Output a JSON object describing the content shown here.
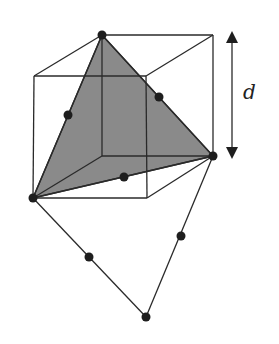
{
  "diagram": {
    "dimension_label": "d",
    "colors": {
      "stroke": "#2a2a2a",
      "shade": "#8a8a8a",
      "dot": "#1e1e1e",
      "background": "#ffffff"
    },
    "cube": {
      "front_top_left": [
        34,
        76
      ],
      "front_top_right": [
        146,
        76
      ],
      "front_bottom_left": [
        33,
        198
      ],
      "front_bottom_right": [
        147,
        198
      ],
      "back_top_left": [
        102,
        35
      ],
      "back_top_right": [
        213,
        35
      ],
      "back_bottom_left": [
        102,
        156
      ],
      "back_bottom_right": [
        213,
        156
      ]
    },
    "shaded_triangle": [
      [
        102,
        35
      ],
      [
        213,
        156
      ],
      [
        33,
        198
      ]
    ],
    "quadrilateral": [
      [
        33,
        198
      ],
      [
        213,
        156
      ],
      [
        146,
        317
      ]
    ],
    "vertices": [
      {
        "name": "top",
        "pos": [
          102,
          35
        ]
      },
      {
        "name": "right",
        "pos": [
          213,
          156
        ]
      },
      {
        "name": "left",
        "pos": [
          33,
          198
        ]
      },
      {
        "name": "bottom",
        "pos": [
          146,
          317
        ]
      }
    ],
    "midpoints": [
      {
        "name": "top-left-edge",
        "pos": [
          68,
          115
        ]
      },
      {
        "name": "top-right-edge",
        "pos": [
          159,
          97
        ]
      },
      {
        "name": "base-edge",
        "pos": [
          124,
          177
        ]
      },
      {
        "name": "lower-left-edge",
        "pos": [
          89,
          257
        ]
      },
      {
        "name": "lower-right-edge",
        "pos": [
          181,
          236
        ]
      }
    ],
    "dimension_arrow": {
      "x": 232,
      "y_top": 33,
      "y_bottom": 157
    }
  }
}
